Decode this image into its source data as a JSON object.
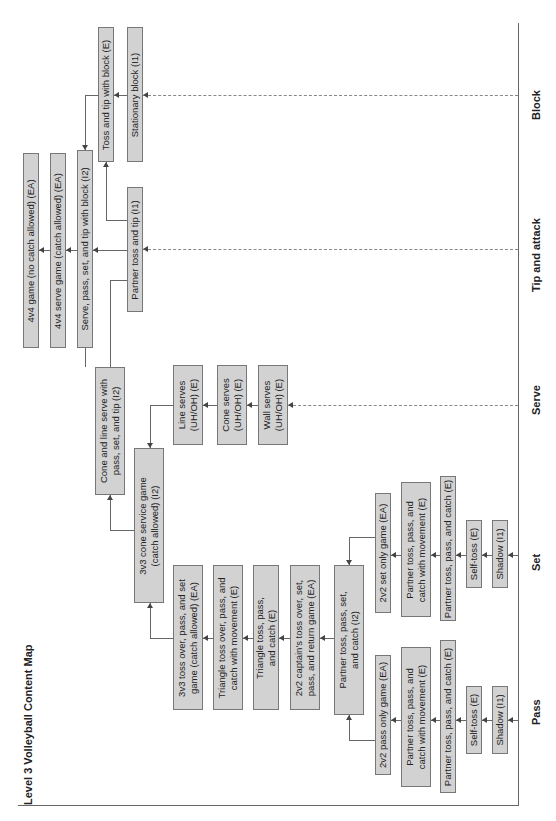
{
  "title": "Level 3 Volleyball Content Map",
  "axis": {
    "categories": [
      "Block",
      "Tip and attack",
      "Serve",
      "Set",
      "Pass"
    ]
  },
  "games": {
    "g4v4_no_catch": "4v4 game (no catch allowed) (EA)",
    "g4v4_serve": "4v4 serve game (catch allowed) (EA)",
    "serve_pass_set_tip_block": "Serve, pass, set, and tip with block (I2)"
  },
  "block": {
    "toss_tip_block": "Toss and tip with block (E)",
    "stationary_block": "Stationary block (I1)"
  },
  "tip": {
    "partner_toss_tip": "Partner toss and tip (I1)"
  },
  "serve": {
    "cone_line_serve": "Cone and line serve with\npass, set, and tip (I2)",
    "line_serves": "Line serves\n(UH/OH) (E)",
    "cone_serves": "Cone serves\n(UH/OH) (E)",
    "wall_serves": "Wall serves\n(UH/OH) (E)",
    "cone_service_3v3": "3v3 cone service game\n(catch allowed) (I2)"
  },
  "combined": {
    "toss_over_3v3": "3v3 toss over, pass, and set\ngame (catch allowed) (EA)",
    "triangle_toss_over": "Triangle toss over, pass, and\ncatch with movement (E)",
    "triangle_toss": "Triangle toss, pass,\nand catch (E)",
    "captains_2v2": "2v2 captain's toss over, set,\npass, and return game (EA)",
    "partner_toss_pass_set": "Partner toss, pass, set,\nand catch (I2)"
  },
  "set": {
    "set_only_2v2": "2v2 set only game (EA)",
    "partner_movement": "Partner toss, pass, and\ncatch with movement (E)",
    "partner_toss": "Partner toss, pass, and catch (E)",
    "self_toss": "Self-toss (E)",
    "shadow": "Shadow (I1)"
  },
  "pass": {
    "pass_only_2v2": "2v2 pass only game (EA)",
    "partner_movement": "Partner toss, pass, and\ncatch with movement (E)",
    "partner_toss": "Partner toss, pass, and catch (E)",
    "self_toss": "Self-toss (E)",
    "shadow": "Shadow (I1)"
  }
}
